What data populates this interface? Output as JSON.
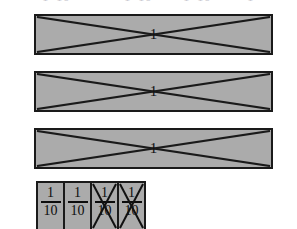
{
  "figure": {
    "background_color": "#ffffff",
    "bar_fill_color": "#ababab",
    "line_color": "#1a1a1a",
    "text_color": "#0d0d0d"
  },
  "clipped_text_row": {
    "note": "cut-off text fragments at top edge",
    "fragments": [
      "1",
      "10",
      "1",
      "10",
      "1",
      "10",
      "1"
    ]
  },
  "whole_bars": [
    {
      "label": "1",
      "crossed_out": true
    },
    {
      "label": "1",
      "crossed_out": true
    },
    {
      "label": "1",
      "crossed_out": true
    }
  ],
  "tenths_strip": {
    "cells": [
      {
        "numerator": "1",
        "denominator": "10",
        "crossed_out": false
      },
      {
        "numerator": "1",
        "denominator": "10",
        "crossed_out": false
      },
      {
        "numerator": "1",
        "denominator": "10",
        "crossed_out": true
      },
      {
        "numerator": "1",
        "denominator": "10",
        "crossed_out": true
      }
    ]
  }
}
